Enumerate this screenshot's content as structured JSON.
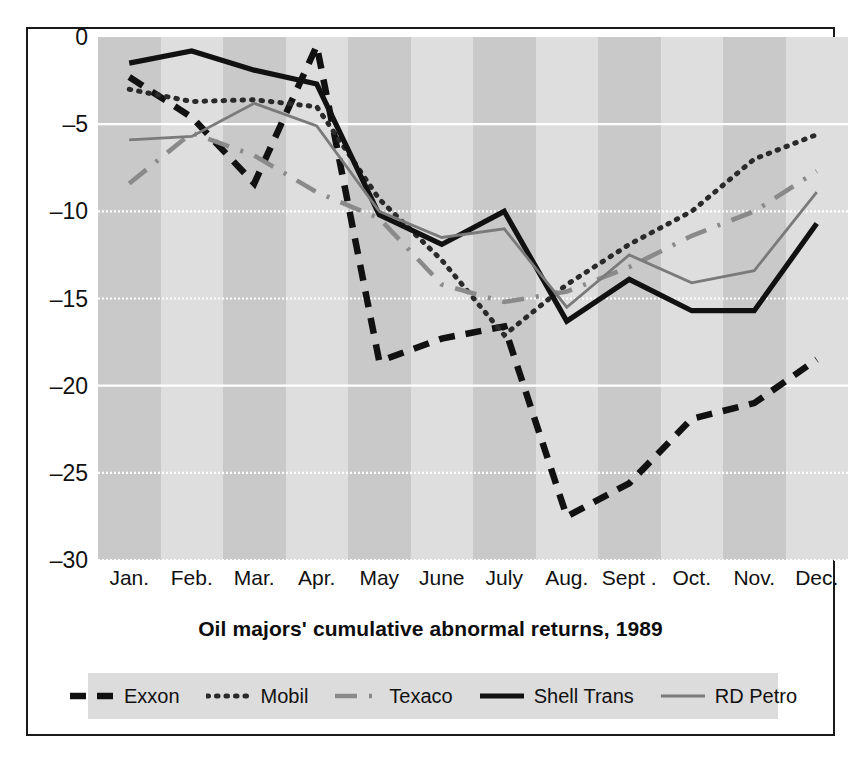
{
  "chart_data": {
    "type": "line",
    "title": "Oil majors' cumulative abnormal returns, 1989",
    "xlabel": "",
    "ylabel": "Percentage return",
    "ylim": [
      -30,
      0
    ],
    "yticks": [
      0,
      -5,
      -10,
      -15,
      -20,
      -25,
      -30
    ],
    "ytick_labels": [
      "0",
      "–5",
      "–10",
      "–15",
      "–20",
      "–25",
      "–30"
    ],
    "grid": "horizontal dotted white gridlines, alternating vertical shaded month bands",
    "legend_position": "below plot, horizontal, shaded box",
    "categories": [
      "Jan.",
      "Feb.",
      "Mar.",
      "Apr.",
      "May",
      "June",
      "July",
      "Aug.",
      "Sept .",
      "Oct.",
      "Nov.",
      "Dec."
    ],
    "series": [
      {
        "name": "Exxon",
        "style": "dashed",
        "color": "#111111",
        "values": [
          -2.3,
          -4.6,
          -8.4,
          -0.5,
          -18.6,
          -17.3,
          -16.6,
          -27.5,
          -25.6,
          -21.9,
          -21.0,
          -18.5
        ]
      },
      {
        "name": "Mobil",
        "style": "dotted",
        "color": "#2a2a2a",
        "values": [
          -3.0,
          -3.7,
          -3.6,
          -4.0,
          -9.3,
          -12.8,
          -17.1,
          -14.2,
          -11.9,
          -10.0,
          -7.0,
          -5.6
        ]
      },
      {
        "name": "Texaco",
        "style": "dash-dot",
        "color": "#8a8a8a",
        "values": [
          -8.4,
          -5.5,
          -6.8,
          -8.9,
          -10.4,
          -14.2,
          -15.2,
          -14.6,
          -13.2,
          -11.4,
          -10.0,
          -7.7
        ]
      },
      {
        "name": "Shell Trans",
        "style": "solid-thick",
        "color": "#111111",
        "values": [
          -1.5,
          -0.8,
          -1.9,
          -2.7,
          -10.2,
          -11.9,
          -10.0,
          -16.3,
          -13.9,
          -15.7,
          -15.7,
          -10.7
        ]
      },
      {
        "name": "RD Petro",
        "style": "solid-thin",
        "color": "#7a7a7a",
        "values": [
          -5.9,
          -5.7,
          -3.8,
          -5.1,
          -10.0,
          -11.5,
          -11.0,
          -15.5,
          -12.5,
          -14.1,
          -13.4,
          -8.9
        ]
      }
    ]
  },
  "legend": {
    "items": [
      {
        "label": "Exxon",
        "swatch": "dashed-swatch"
      },
      {
        "label": "Mobil",
        "swatch": "dotted-swatch"
      },
      {
        "label": "Texaco",
        "swatch": "dash-dot-swatch"
      },
      {
        "label": "Shell Trans",
        "swatch": "solid-thick-swatch"
      },
      {
        "label": "RD Petro",
        "swatch": "solid-thin-swatch"
      }
    ]
  },
  "colors": {
    "frame": "#1a1a1a",
    "band_dark": "#c9c9c9",
    "band_light": "#dedede",
    "gridline": "#ffffff",
    "legend_bg": "#dcdcdc"
  }
}
